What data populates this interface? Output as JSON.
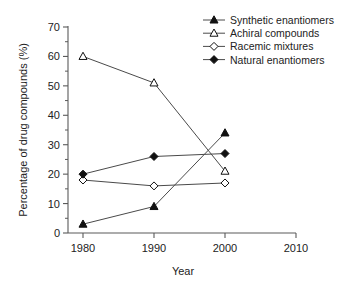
{
  "chart_data": {
    "type": "line",
    "title": "",
    "xlabel": "Year",
    "ylabel": "Percentage of drug compounds (%)",
    "x": [
      1980,
      1990,
      2000
    ],
    "xlim": [
      1975,
      2012
    ],
    "ylim": [
      0,
      70
    ],
    "xticks": [
      1980,
      1990,
      2000,
      2010
    ],
    "xtick_labels": [
      "1980",
      "1990",
      "2000",
      "2010"
    ],
    "yticks": [
      0,
      10,
      20,
      30,
      40,
      50,
      60,
      70
    ],
    "ytick_labels": [
      "0",
      "10",
      "20",
      "30",
      "40",
      "50",
      "60",
      "70"
    ],
    "y_minor_step": 5,
    "grid": false,
    "legend_position": "top-right",
    "series": [
      {
        "name": "Synthetic enantiomers",
        "marker": "filled-triangle",
        "values": [
          3,
          9,
          34
        ]
      },
      {
        "name": "Achiral compounds",
        "marker": "open-triangle",
        "values": [
          60,
          51,
          21
        ]
      },
      {
        "name": "Racemic mixtures",
        "marker": "open-diamond",
        "values": [
          18,
          16,
          17
        ]
      },
      {
        "name": "Natural enantiomers",
        "marker": "filled-diamond",
        "values": [
          20,
          26,
          27
        ]
      }
    ]
  },
  "colors": {
    "line": "#4a4a4a",
    "axis": "#5a5a5a",
    "marker_fill": "#111111",
    "marker_open": "#ffffff",
    "text": "#222222",
    "background": "#ffffff"
  }
}
